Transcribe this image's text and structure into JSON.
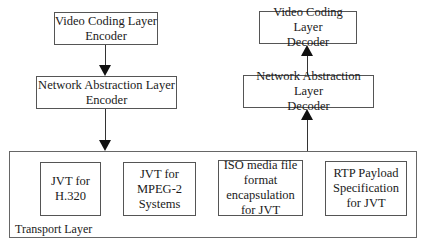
{
  "diagram": {
    "encoder": {
      "vcl": "Video Coding Layer\nEncoder",
      "nal": "Network Abstraction Layer\nEncoder"
    },
    "decoder": {
      "vcl": "Video Coding Layer\nDecoder",
      "nal": "Network Abstraction Layer\nDecoder"
    },
    "transport": {
      "label": "Transport Layer",
      "items": [
        "JVT for\nH.320",
        "JVT for\nMPEG-2\nSystems",
        "ISO media file\nformat\nencapsulation\nfor JVT",
        "RTP Payload\nSpecification\nfor JVT"
      ]
    }
  }
}
